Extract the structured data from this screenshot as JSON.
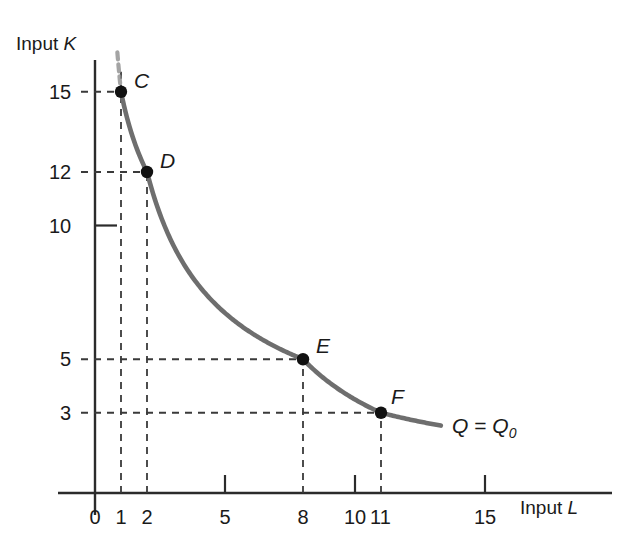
{
  "chart_data": {
    "type": "line",
    "title": "",
    "subtitle": "",
    "xlabel": "Input L",
    "ylabel": "Input K",
    "xlim": [
      0,
      19.3
    ],
    "ylim": [
      0,
      18.8
    ],
    "grid": false,
    "legend_position": "inline-right",
    "annotations": [
      {
        "name": "isoquant-label",
        "text_q": "Q",
        "text_eq": " = ",
        "text_q0": "Q",
        "text_sub": "0",
        "x": 13.5,
        "y": 2.0
      }
    ],
    "x_ticks": [
      {
        "value": 0,
        "label": "0",
        "tick_mark": false,
        "dashed": false
      },
      {
        "value": 1,
        "label": "1",
        "tick_mark": false,
        "dashed": true
      },
      {
        "value": 2,
        "label": "2",
        "tick_mark": false,
        "dashed": true
      },
      {
        "value": 5,
        "label": "5",
        "tick_mark": true,
        "dashed": false
      },
      {
        "value": 8,
        "label": "8",
        "tick_mark": false,
        "dashed": true
      },
      {
        "value": 10,
        "label": "10",
        "tick_mark": true,
        "dashed": false
      },
      {
        "value": 11,
        "label": "11",
        "tick_mark": false,
        "dashed": true
      },
      {
        "value": 15,
        "label": "15",
        "tick_mark": true,
        "dashed": false
      }
    ],
    "y_ticks": [
      {
        "value": 15,
        "label": "15",
        "tick_mark": false,
        "dashed": true
      },
      {
        "value": 12,
        "label": "12",
        "tick_mark": false,
        "dashed": true
      },
      {
        "value": 10,
        "label": "10",
        "tick_mark": true,
        "dashed": false
      },
      {
        "value": 5,
        "label": "5",
        "tick_mark": false,
        "dashed": true
      },
      {
        "value": 3,
        "label": "3",
        "tick_mark": false,
        "dashed": true
      }
    ],
    "series": [
      {
        "name": "Q = Q0",
        "color": "#6e6e6e",
        "x": [
          1,
          2,
          8,
          11
        ],
        "values": [
          15,
          12,
          5,
          3
        ],
        "point_labels": [
          "C",
          "D",
          "E",
          "F"
        ]
      }
    ],
    "points": [
      {
        "label": "C",
        "x": 1,
        "y": 15
      },
      {
        "label": "D",
        "x": 2,
        "y": 12
      },
      {
        "label": "E",
        "x": 8,
        "y": 5
      },
      {
        "label": "F",
        "x": 11,
        "y": 3
      }
    ]
  },
  "axes": {
    "y_axis_title_prefix": "Input ",
    "y_axis_title_var": "K",
    "x_axis_title_prefix": "Input ",
    "x_axis_title_var": "L"
  },
  "colors": {
    "curve": "#6e6e6e",
    "axis": "#2b2b2b",
    "dash": "#3a3a3a",
    "point": "#111111",
    "text": "#1a1a1a",
    "background": "#ffffff"
  }
}
